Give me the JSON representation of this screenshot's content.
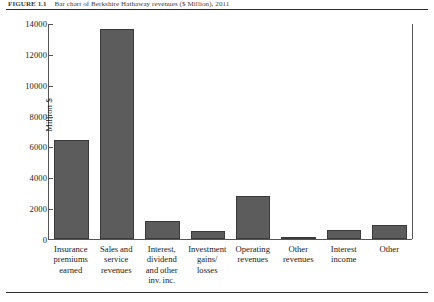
{
  "figure": {
    "caption_label": "FIGURE 1.1",
    "caption_text": "Bar chart of Berkshire Hathaway revenues ($ Million), 2011"
  },
  "chart_data": {
    "type": "bar",
    "title": "",
    "xlabel": "",
    "ylabel": "Million $",
    "ylim": [
      0,
      14000
    ],
    "yticks": [
      0,
      2000,
      4000,
      6000,
      8000,
      10000,
      12000,
      14000
    ],
    "ytick_labels": [
      "0",
      "2000",
      "4000",
      "6000",
      "8000",
      "10000",
      "12000",
      "14000"
    ],
    "grid": false,
    "legend": "none",
    "bar_color": "#5c5c5c",
    "categories": [
      "Insurance premiums earned",
      "Sales and service revenues",
      "Interest, dividend and other inv. inc.",
      "Investment gains/ losses",
      "Operating revenues",
      "Other revenues",
      "Interest income",
      "Other"
    ],
    "category_lines": [
      [
        "Insurance",
        "premiums",
        "earned"
      ],
      [
        "Sales and",
        "service",
        "revenues"
      ],
      [
        "Interest,",
        "dividend",
        "and other",
        "inv. inc."
      ],
      [
        "Investment",
        "gains/",
        "losses"
      ],
      [
        "Operating",
        "revenues"
      ],
      [
        "Other",
        "revenues"
      ],
      [
        "Interest",
        "income"
      ],
      [
        "Other"
      ]
    ],
    "values": [
      6400,
      13600,
      1200,
      520,
      2800,
      100,
      580,
      920
    ]
  }
}
